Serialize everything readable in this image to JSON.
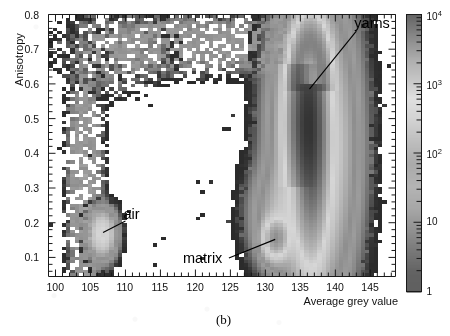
{
  "figure": {
    "caption": "(b)",
    "panel_label": "(b)"
  },
  "chart_data": {
    "type": "heatmap",
    "title": "",
    "subtitle": "",
    "xlabel": "Average grey value",
    "ylabel": "Anisotropy",
    "xlim": [
      99.0,
      148.6
    ],
    "ylim": [
      0.045,
      0.8
    ],
    "grid": false,
    "xticks": [
      100,
      105,
      110,
      115,
      120,
      125,
      130,
      135,
      140,
      145
    ],
    "xtick_labels": [
      "100",
      "105",
      "110",
      "115",
      "120",
      "125",
      "130",
      "135",
      "140",
      "145"
    ],
    "x_minor_tick_step": 1,
    "yticks": [
      0.1,
      0.2,
      0.3,
      0.4,
      0.5,
      0.6,
      0.7,
      0.8
    ],
    "ytick_labels": [
      "0.1",
      "0.2",
      "0.3",
      "0.4",
      "0.5",
      "0.6",
      "0.7",
      "0.8"
    ],
    "y_minor_tick_step": 0.02,
    "colorbar": {
      "scale": "log",
      "vmin": 1,
      "vmax": 10000,
      "position": "right",
      "tick_values": [
        1,
        10,
        100,
        1000,
        10000
      ],
      "tick_labels": [
        "1",
        "10",
        "10",
        "10",
        "10"
      ],
      "tick_exponents": [
        "",
        "",
        "2",
        "3",
        "4"
      ],
      "colormap": "grayscale-nonmonotonic",
      "stops": [
        {
          "t": 0.0,
          "color": "#2b2b2b"
        },
        {
          "t": 0.07,
          "color": "#303030"
        },
        {
          "t": 0.14,
          "color": "#4a4a4a"
        },
        {
          "t": 0.22,
          "color": "#6d6d6d"
        },
        {
          "t": 0.3,
          "color": "#8a8a8a"
        },
        {
          "t": 0.38,
          "color": "#9c9c9c"
        },
        {
          "t": 0.46,
          "color": "#8e8e8e"
        },
        {
          "t": 0.54,
          "color": "#a8a8a8"
        },
        {
          "t": 0.62,
          "color": "#c4c4c4"
        },
        {
          "t": 0.7,
          "color": "#d6d6d6"
        },
        {
          "t": 0.76,
          "color": "#b6b6b6"
        },
        {
          "t": 0.83,
          "color": "#979797"
        },
        {
          "t": 0.9,
          "color": "#6f6f6f"
        },
        {
          "t": 0.96,
          "color": "#4a4a4a"
        },
        {
          "t": 1.0,
          "color": "#333333"
        }
      ]
    },
    "bin_size": {
      "x": 0.62,
      "y": 0.0095
    },
    "annotations": [
      {
        "text": "yarns",
        "label_x": 143.0,
        "label_y": 0.775,
        "point_x": 136.3,
        "point_y": 0.585,
        "description": "dense high-anisotropy yarn population"
      },
      {
        "text": "air",
        "label_x": 110.0,
        "label_y": 0.225,
        "point_x": 106.8,
        "point_y": 0.172,
        "description": "low grey value, low anisotropy air population"
      },
      {
        "text": "matrix",
        "label_x": 124.5,
        "label_y": 0.098,
        "point_x": 131.4,
        "point_y": 0.152,
        "description": "matrix population at mid grey value, low anisotropy"
      }
    ],
    "populations": [
      {
        "name": "yarns-core",
        "kind": "gaussian-ridge",
        "peak_counts": 7000,
        "center_x": 136.6,
        "center_y": 0.47,
        "sigma_x": 1.15,
        "sigma_y": 0.115,
        "notes": "elongated vertical lobe, arcs over at top near anisotropy 0.70"
      },
      {
        "name": "yarns-halo",
        "kind": "gaussian-ridge",
        "peak_counts": 900,
        "center_x": 136.9,
        "center_y": 0.42,
        "sigma_x": 2.6,
        "sigma_y": 0.2,
        "notes": "broad light-grey envelope around the yarn core"
      },
      {
        "name": "yarns-arch",
        "kind": "arc",
        "peak_counts": 2600,
        "center_x": 136.4,
        "center_y": 0.6,
        "radius_x": 1.9,
        "radius_y": 0.12,
        "notes": "U-turn of the ridge at high anisotropy"
      },
      {
        "name": "matrix",
        "kind": "gaussian",
        "peak_counts": 2200,
        "center_x": 131.5,
        "center_y": 0.155,
        "sigma_x": 0.95,
        "sigma_y": 0.03
      },
      {
        "name": "air",
        "kind": "gaussian",
        "peak_counts": 700,
        "center_x": 106.7,
        "center_y": 0.168,
        "sigma_x": 0.95,
        "sigma_y": 0.033
      },
      {
        "name": "air-tail",
        "kind": "ridge",
        "peak_counts": 60,
        "center_x": 104.2,
        "center_y": 0.3,
        "sigma_x": 1.1,
        "sigma_y": 0.17,
        "notes": "sparse vertical tail rising from the air peak"
      },
      {
        "name": "upper-plateau",
        "kind": "band",
        "peak_counts": 40,
        "y_center": 0.715,
        "y_sigma": 0.038,
        "x_from": 106.5,
        "x_to": 141.0,
        "notes": "sparse dark speckled band joining air tail to yarn arch"
      },
      {
        "name": "sparse-background",
        "kind": "speckle",
        "peak_counts": 3,
        "notes": "isolated single-count dark bins scattered across the empty interior"
      }
    ]
  }
}
